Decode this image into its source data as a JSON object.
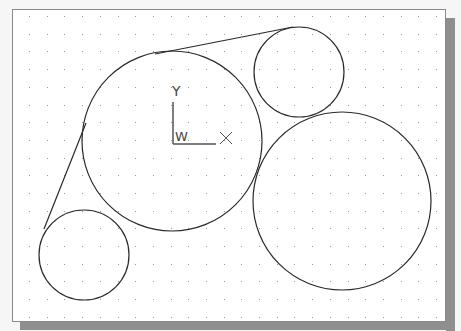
{
  "drawing": {
    "background": "#ffffff",
    "line_color": "#2a2a2a",
    "grid": {
      "dot_color": "#9a9a9a",
      "spacing": 17.7,
      "origin_x": 29,
      "origin_y": 16
    },
    "circles": [
      {
        "name": "large-center-circle",
        "cx": 172,
        "cy": 141,
        "r": 90
      },
      {
        "name": "small-top-right-circle",
        "cx": 299,
        "cy": 72,
        "r": 45
      },
      {
        "name": "large-right-circle",
        "cx": 342,
        "cy": 201,
        "r": 89
      },
      {
        "name": "small-bottom-left-circle",
        "cx": 84,
        "cy": 255,
        "r": 45
      }
    ],
    "lines": [
      {
        "name": "tangent-line-left",
        "x1": 44,
        "y1": 229,
        "x2": 86,
        "y2": 123
      },
      {
        "name": "tangent-line-top",
        "x1": 155,
        "y1": 54,
        "x2": 293,
        "y2": 27
      }
    ]
  },
  "ucs_icon": {
    "y_label": "Y",
    "x_label": "X",
    "w_label": "W"
  }
}
